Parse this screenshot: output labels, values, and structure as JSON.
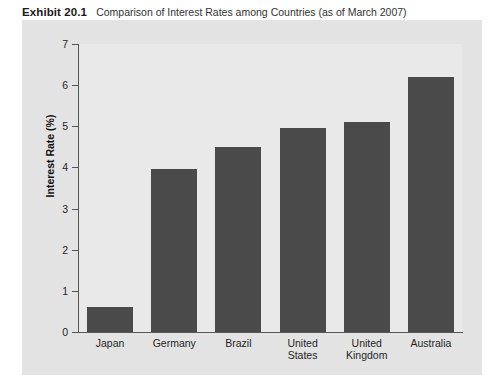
{
  "caption": {
    "number": "Exhibit 20.1",
    "title": "Comparison of Interest Rates among Countries (as of March 2007)"
  },
  "colors": {
    "bar": "#4a4a4a",
    "panel_background": "#e3e3e3",
    "plot_background": "#e9e9e9",
    "axis": "#555555",
    "page_background": "#ffffff"
  },
  "chart_data": {
    "type": "bar",
    "title": "Comparison of Interest Rates among Countries (as of March 2007)",
    "xlabel": "",
    "ylabel": "Interest Rate (%)",
    "ylim": [
      0,
      7
    ],
    "ytick_labels": [
      "0",
      "1",
      "2",
      "3",
      "4",
      "5",
      "6",
      "7"
    ],
    "ytick_values": [
      0,
      1,
      2,
      3,
      4,
      5,
      6,
      7
    ],
    "grid": false,
    "legend": false,
    "categories": [
      [
        "Japan"
      ],
      [
        "Germany"
      ],
      [
        "Brazil"
      ],
      [
        "United",
        "States"
      ],
      [
        "United",
        "Kingdom"
      ],
      [
        "Australia"
      ]
    ],
    "category_labels": [
      "Japan",
      "Germany",
      "Brazil",
      "United States",
      "United Kingdom",
      "Australia"
    ],
    "values": [
      0.6,
      3.97,
      4.5,
      4.95,
      5.1,
      6.2
    ]
  }
}
